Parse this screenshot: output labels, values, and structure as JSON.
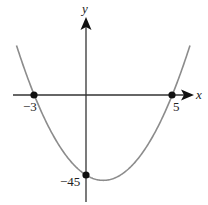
{
  "chart_data": {
    "type": "line",
    "title": "",
    "function": "y = 3(x + 3)(x - 5)",
    "xlabel": "x",
    "ylabel": "y",
    "xlim": [
      -4.03,
      6.03
    ],
    "ylim": [
      -48,
      28
    ],
    "grid": false,
    "legend": null,
    "marked_points": [
      {
        "x": -3,
        "y": 0,
        "label": "−3"
      },
      {
        "x": 5,
        "y": 0,
        "label": "5"
      },
      {
        "x": 0,
        "y": -45,
        "label": "−45"
      }
    ],
    "vertex": {
      "x": 1,
      "y": -48
    },
    "series": [
      {
        "name": "parabola",
        "color": "#8c8c8c",
        "x": [
          -4,
          -3,
          -2,
          -1,
          0,
          1,
          2,
          3,
          4,
          5,
          6
        ],
        "values": [
          27,
          0,
          -21,
          -36,
          -45,
          -48,
          -45,
          -36,
          -21,
          0,
          27
        ]
      }
    ]
  },
  "colors": {
    "axis": "#333333",
    "curve": "#8c8c8c",
    "point": "#111111"
  }
}
